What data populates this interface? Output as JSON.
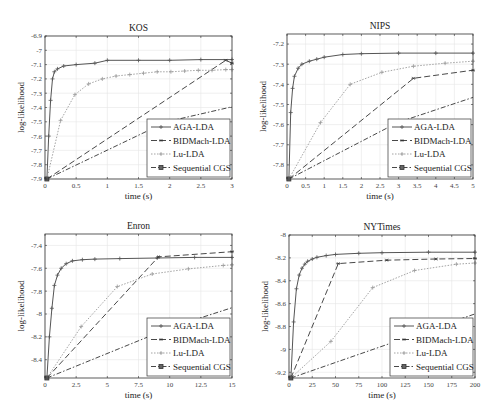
{
  "figure": {
    "width": 495,
    "height": 417
  },
  "styles": {
    "AGA-LDA": {
      "color": "#555555",
      "dash": "",
      "marker": "plus",
      "width": 1.0
    },
    "BIDMach-LDA": {
      "color": "#333333",
      "dash": "6,3",
      "marker": "star",
      "width": 0.9
    },
    "Lu-LDA": {
      "color": "#999999",
      "dash": "1.5,1.5",
      "marker": "plus",
      "width": 0.9
    },
    "Sequential CGS": {
      "color": "#333333",
      "dash": "5,2,1.5,2",
      "marker": "square",
      "width": 0.9
    }
  },
  "chart_data": [
    {
      "type": "line",
      "title": "KOS",
      "xlabel": "time (s)",
      "ylabel": "log-likelihood",
      "xlim": [
        0,
        3
      ],
      "ylim": [
        -7.9,
        -6.9
      ],
      "xticks": [
        0,
        0.5,
        1,
        1.5,
        2,
        2.5,
        3
      ],
      "xtick_labels": [
        "0",
        "0.5",
        "1",
        "1.5",
        "2",
        "2.5",
        "3"
      ],
      "yticks": [
        -7.9,
        -7.8,
        -7.7,
        -7.6,
        -7.5,
        -7.4,
        -7.3,
        -7.2,
        -7.1,
        -7,
        -6.9
      ],
      "ytick_labels": [
        "-7.9",
        "-7.8",
        "-7.7",
        "-7.6",
        "-7.5",
        "-7.4",
        "-7.3",
        "-7.2",
        "-7.1",
        "-7",
        "-6.9"
      ],
      "grid": true,
      "legend_position": "lower right",
      "box": {
        "x": 45,
        "y": 36,
        "w": 187,
        "h": 143
      },
      "series": [
        {
          "name": "AGA-LDA",
          "x": [
            0.03,
            0.06,
            0.09,
            0.12,
            0.15,
            0.2,
            0.3,
            0.5,
            0.8,
            1.0,
            1.5,
            2.0,
            2.5,
            3.0
          ],
          "y": [
            -7.9,
            -7.6,
            -7.35,
            -7.2,
            -7.15,
            -7.13,
            -7.11,
            -7.1,
            -7.09,
            -7.07,
            -7.07,
            -7.07,
            -7.065,
            -7.065
          ],
          "marker_every": 1
        },
        {
          "name": "BIDMach-LDA",
          "x": [
            0.03,
            2.9,
            3.0
          ],
          "y": [
            -7.9,
            -7.07,
            -7.09
          ],
          "marker_every": 1
        },
        {
          "name": "Lu-LDA",
          "x": [
            0.03,
            0.25,
            0.48,
            0.7,
            0.92,
            1.14,
            1.36,
            1.58,
            1.8,
            2.02,
            2.24,
            2.46,
            2.68,
            2.9,
            3.0
          ],
          "y": [
            -7.9,
            -7.49,
            -7.31,
            -7.235,
            -7.2,
            -7.18,
            -7.17,
            -7.16,
            -7.15,
            -7.15,
            -7.145,
            -7.14,
            -7.14,
            -7.135,
            -7.135
          ],
          "marker_every": 1
        },
        {
          "name": "Sequential CGS",
          "x": [
            0.03,
            1.95,
            3.0
          ],
          "y": [
            -7.9,
            -7.5,
            -7.395
          ],
          "marker_every": 1
        }
      ]
    },
    {
      "type": "line",
      "title": "NIPS",
      "xlabel": "time (s)",
      "ylabel": "log-likelihood",
      "xlim": [
        0,
        5
      ],
      "ylim": [
        -7.87,
        -7.15
      ],
      "xticks": [
        0,
        0.5,
        1,
        1.5,
        2,
        2.5,
        3,
        3.5,
        4,
        4.5,
        5
      ],
      "xtick_labels": [
        "0",
        "0.5",
        "1",
        "1.5",
        "2",
        "2.5",
        "3",
        "3.5",
        "4",
        "4.5",
        "5"
      ],
      "yticks": [
        -7.8,
        -7.7,
        -7.6,
        -7.5,
        -7.4,
        -7.3,
        -7.2
      ],
      "ytick_labels": [
        "-7.8",
        "-7.7",
        "-7.6",
        "-7.5",
        "-7.4",
        "-7.3",
        "-7.2"
      ],
      "grid": true,
      "legend_position": "lower right",
      "box": {
        "x": 287,
        "y": 34,
        "w": 186,
        "h": 145
      },
      "series": [
        {
          "name": "AGA-LDA",
          "x": [
            0.05,
            0.1,
            0.15,
            0.2,
            0.3,
            0.4,
            0.6,
            0.8,
            1.0,
            1.5,
            2.0,
            3.0,
            4.0,
            5.0
          ],
          "y": [
            -7.87,
            -7.54,
            -7.42,
            -7.36,
            -7.32,
            -7.3,
            -7.285,
            -7.275,
            -7.265,
            -7.252,
            -7.248,
            -7.245,
            -7.245,
            -7.245
          ],
          "marker_every": 1
        },
        {
          "name": "BIDMach-LDA",
          "x": [
            0.05,
            3.4,
            5.0
          ],
          "y": [
            -7.87,
            -7.37,
            -7.33
          ],
          "marker_every": 1
        },
        {
          "name": "Lu-LDA",
          "x": [
            0.05,
            0.9,
            1.7,
            2.55,
            3.4,
            4.25,
            5.0
          ],
          "y": [
            -7.87,
            -7.59,
            -7.4,
            -7.34,
            -7.31,
            -7.295,
            -7.285
          ],
          "marker_every": 1
        },
        {
          "name": "Sequential CGS",
          "x": [
            0.05,
            2.97,
            5.0
          ],
          "y": [
            -7.87,
            -7.59,
            -7.465
          ],
          "marker_every": 1
        }
      ]
    },
    {
      "type": "line",
      "title": "Enron",
      "xlabel": "time (s)",
      "ylabel": "log-likelihood",
      "xlim": [
        0,
        15
      ],
      "ylim": [
        -8.56,
        -7.3
      ],
      "xticks": [
        0,
        2.5,
        5,
        7.5,
        10,
        12.5,
        15
      ],
      "xtick_labels": [
        "0",
        "2.5",
        "5",
        "7.5",
        "10",
        "12.5",
        "15"
      ],
      "yticks": [
        -8.4,
        -8.2,
        -8,
        -7.8,
        -7.6,
        -7.4
      ],
      "ytick_labels": [
        "-8.4",
        "-8.2",
        "-8",
        "-7.8",
        "-7.6",
        "-7.4"
      ],
      "grid": true,
      "legend_position": "lower right",
      "box": {
        "x": 45,
        "y": 234,
        "w": 187,
        "h": 144
      },
      "series": [
        {
          "name": "AGA-LDA",
          "x": [
            0.15,
            0.35,
            0.55,
            0.75,
            1.0,
            1.3,
            1.7,
            2.2,
            3.0,
            4.0,
            6.0,
            9.0,
            12.0,
            15.0
          ],
          "y": [
            -8.56,
            -8.2,
            -7.95,
            -7.75,
            -7.66,
            -7.6,
            -7.56,
            -7.535,
            -7.525,
            -7.52,
            -7.515,
            -7.51,
            -7.505,
            -7.505
          ],
          "marker_every": 1
        },
        {
          "name": "BIDMach-LDA",
          "x": [
            0.15,
            9.1,
            15.0
          ],
          "y": [
            -8.56,
            -7.5,
            -7.455
          ],
          "marker_every": 1
        },
        {
          "name": "Lu-LDA",
          "x": [
            0.15,
            2.9,
            5.8,
            8.6,
            11.5,
            14.3,
            15.0
          ],
          "y": [
            -8.56,
            -8.11,
            -7.76,
            -7.65,
            -7.605,
            -7.575,
            -7.57
          ],
          "marker_every": 1
        },
        {
          "name": "Sequential CGS",
          "x": [
            0.15,
            10.3,
            15.0
          ],
          "y": [
            -8.56,
            -8.11,
            -7.945
          ],
          "marker_every": 1
        }
      ]
    },
    {
      "type": "line",
      "title": "NYTimes",
      "xlabel": "time (s)",
      "ylabel": "log-likelihood",
      "xlim": [
        0,
        200
      ],
      "ylim": [
        -9.25,
        -8.0
      ],
      "xticks": [
        0,
        25,
        50,
        75,
        100,
        125,
        150,
        175,
        200
      ],
      "xtick_labels": [
        "0",
        "25",
        "50",
        "75",
        "100",
        "125",
        "150",
        "175",
        "200"
      ],
      "yticks": [
        -9.2,
        -9,
        -8.8,
        -8.6,
        -8.4,
        -8.2,
        -8
      ],
      "ytick_labels": [
        "-9.2",
        "-9",
        "-8.8",
        "-8.6",
        "-8.4",
        "-8.2",
        "-8"
      ],
      "grid": true,
      "legend_position": "lower right",
      "box": {
        "x": 289,
        "y": 235,
        "w": 186,
        "h": 143
      },
      "series": [
        {
          "name": "AGA-LDA",
          "x": [
            2,
            5,
            8,
            11,
            14,
            17,
            20,
            25,
            30,
            40,
            50,
            75,
            100,
            150,
            200
          ],
          "y": [
            -9.25,
            -8.76,
            -8.47,
            -8.35,
            -8.29,
            -8.255,
            -8.23,
            -8.21,
            -8.195,
            -8.18,
            -8.17,
            -8.16,
            -8.155,
            -8.15,
            -8.15
          ],
          "marker_every": 1
        },
        {
          "name": "BIDMach-LDA",
          "x": [
            2,
            53,
            105,
            158,
            200
          ],
          "y": [
            -9.25,
            -8.25,
            -8.22,
            -8.21,
            -8.205
          ],
          "marker_every": 1
        },
        {
          "name": "Lu-LDA",
          "x": [
            2,
            45,
            90,
            135,
            180,
            200
          ],
          "y": [
            -9.25,
            -8.93,
            -8.46,
            -8.31,
            -8.255,
            -8.245
          ],
          "marker_every": 1
        },
        {
          "name": "Sequential CGS",
          "x": [
            2,
            200
          ],
          "y": [
            -9.25,
            -8.69
          ],
          "marker_every": 1
        }
      ]
    }
  ],
  "legend": {
    "entries": [
      "AGA-LDA",
      "BIDMach-LDA",
      "Lu-LDA",
      "Sequential CGS"
    ]
  }
}
